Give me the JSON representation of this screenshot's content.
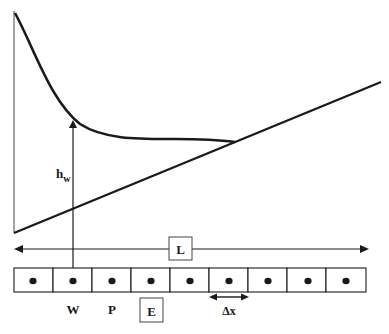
{
  "diagram": {
    "type": "finite-volume water surface profile schematic",
    "colors": {
      "ink": "#1a1a1a",
      "axis": "#555555",
      "background": "#ffffff"
    },
    "labels": {
      "depth": "h",
      "depth_subscript": "w",
      "length": "L",
      "node_west": "W",
      "node_p": "P",
      "node_east": "E",
      "spacing": "Δx"
    },
    "grid": {
      "cell_count": 9,
      "node_marker": "dot"
    }
  }
}
